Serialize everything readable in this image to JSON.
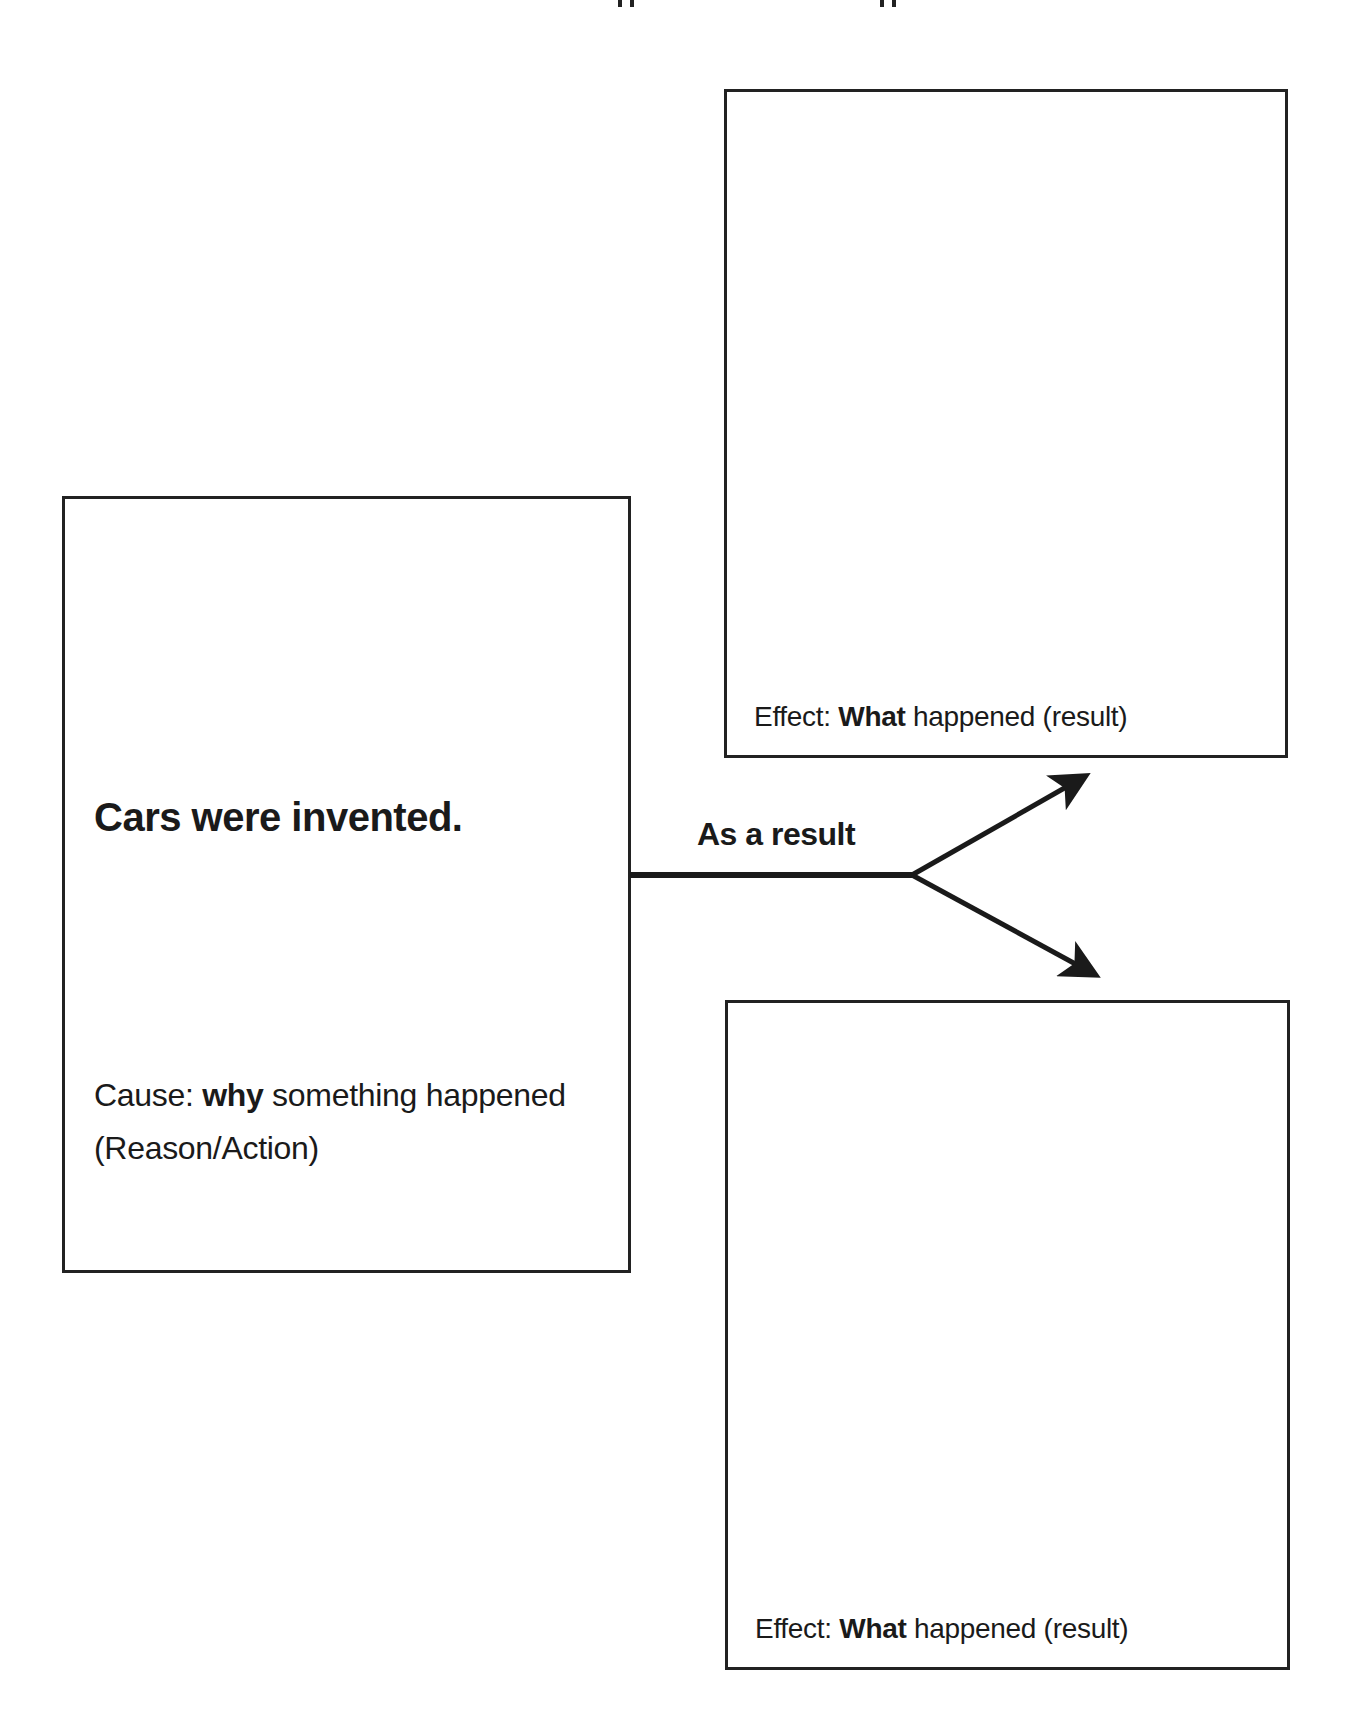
{
  "cause_box": {
    "headline": "Cars were invented.",
    "label_prefix": "Cause: ",
    "label_emphasis": "why",
    "label_suffix": " something happened",
    "label_line2": "(Reason/Action)"
  },
  "connector": {
    "label": "As a result"
  },
  "effect_boxes": [
    {
      "content": "",
      "label_prefix": "Effect: ",
      "label_emphasis": "What",
      "label_suffix": " happened (result)"
    },
    {
      "content": "",
      "label_prefix": "Effect: ",
      "label_emphasis": "What",
      "label_suffix": " happened (result)"
    }
  ],
  "colors": {
    "stroke": "#222222",
    "text": "#1a1a1a",
    "background": "#ffffff"
  }
}
